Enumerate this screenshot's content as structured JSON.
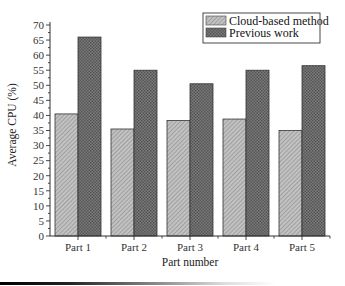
{
  "chart_data": {
    "type": "bar",
    "title": "",
    "xlabel": "Part number",
    "ylabel": "Average CPU (%)",
    "ylim": [
      0,
      70
    ],
    "yticks": [
      0,
      5,
      10,
      15,
      20,
      25,
      30,
      35,
      40,
      45,
      50,
      55,
      60,
      65,
      70
    ],
    "categories": [
      "Part 1",
      "Part 2",
      "Part 3",
      "Part 4",
      "Part 5"
    ],
    "series": [
      {
        "name": "Cloud-based method",
        "values": [
          40.5,
          35.5,
          38.3,
          38.8,
          35
        ],
        "color": "#b4b4b4",
        "pattern": "diagonal-hatch"
      },
      {
        "name": "Previous work",
        "values": [
          66,
          55,
          50.5,
          55,
          56.5
        ],
        "color": "#6e6e6e",
        "pattern": "crosshatch"
      }
    ],
    "legend_position": "top-right",
    "grid": false
  }
}
